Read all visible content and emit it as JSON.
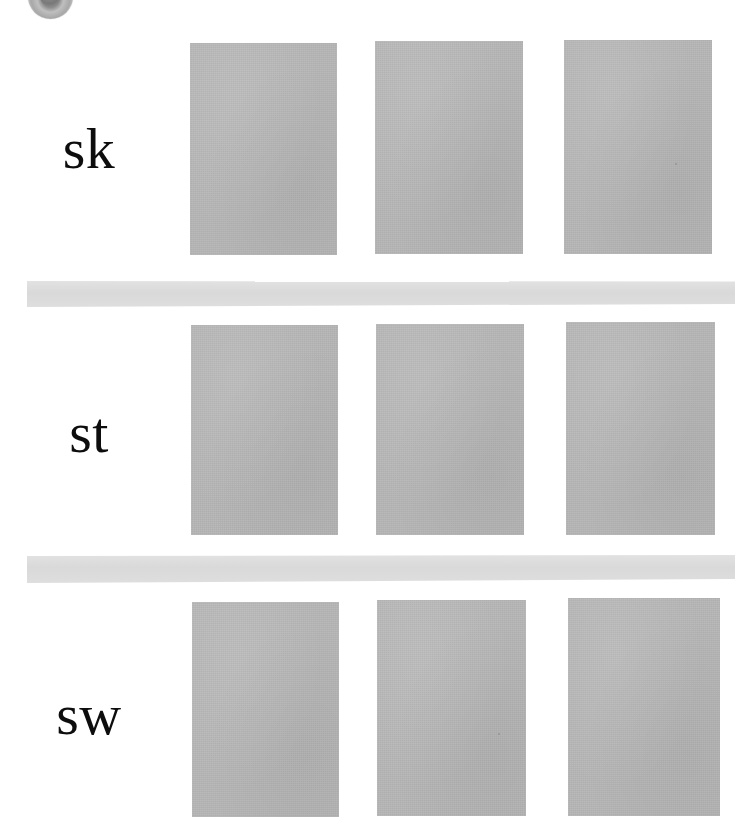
{
  "page": {
    "background_color": "#ffffff",
    "width": 756,
    "height": 831,
    "block_color": "#b5b5b5",
    "separator_color": "#dcdcdc",
    "text_color": "#0d0d0d"
  },
  "seal": {
    "name": "circular-seal",
    "description": "partially cropped circular grayscale seal at top-left"
  },
  "rows": [
    {
      "label": "sk",
      "blocks": [
        {
          "x": 190,
          "y": 43,
          "width": 147,
          "height": 212
        },
        {
          "x": 375,
          "y": 41,
          "width": 148,
          "height": 213
        },
        {
          "x": 564,
          "y": 40,
          "width": 148,
          "height": 214
        }
      ]
    },
    {
      "label": "st",
      "blocks": [
        {
          "x": 191,
          "y": 325,
          "width": 147,
          "height": 210
        },
        {
          "x": 376,
          "y": 324,
          "width": 148,
          "height": 211
        },
        {
          "x": 566,
          "y": 322,
          "width": 149,
          "height": 213
        }
      ]
    },
    {
      "label": "sw",
      "blocks": [
        {
          "x": 192,
          "y": 602,
          "width": 147,
          "height": 215
        },
        {
          "x": 377,
          "y": 600,
          "width": 149,
          "height": 216
        },
        {
          "x": 568,
          "y": 598,
          "width": 152,
          "height": 218
        }
      ]
    }
  ],
  "separators": [
    {
      "name": "separator-band-1",
      "y": 281
    },
    {
      "name": "separator-band-2",
      "y": 555
    }
  ],
  "specks": [
    {
      "x": 498,
      "y": 733
    },
    {
      "x": 675,
      "y": 163
    }
  ]
}
